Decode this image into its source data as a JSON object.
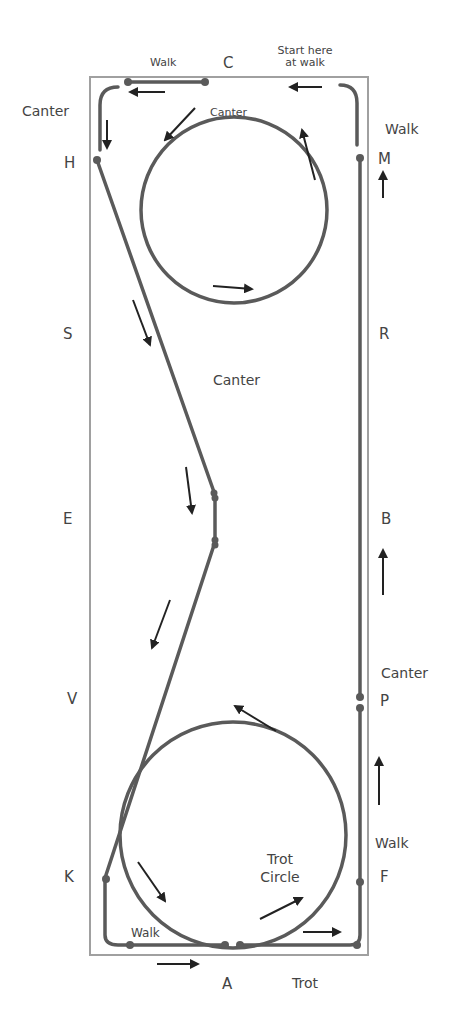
{
  "diagram": {
    "type": "dressage-arena-pattern",
    "letters": {
      "C": "C",
      "H": "H",
      "M": "M",
      "S": "S",
      "R": "R",
      "E": "E",
      "B": "B",
      "V": "V",
      "P": "P",
      "K": "K",
      "F": "F",
      "A": "A"
    },
    "gait_labels": {
      "top_walk": "Walk",
      "start_line1": "Start here",
      "start_line2": "at walk",
      "left_canter": "Canter",
      "top_circle_canter": "Canter",
      "right_walk_top": "Walk",
      "middle_canter": "Canter",
      "right_canter": "Canter",
      "right_walk_bottom": "Walk",
      "trot_circle_line1": "Trot",
      "trot_circle_line2": "Circle",
      "bottom_walk": "Walk",
      "bottom_trot": "Trot"
    },
    "colors": {
      "arena_border": "#9a9a9a",
      "path": "#5a5a5a",
      "arrow": "#222222",
      "text": "#444444"
    }
  }
}
